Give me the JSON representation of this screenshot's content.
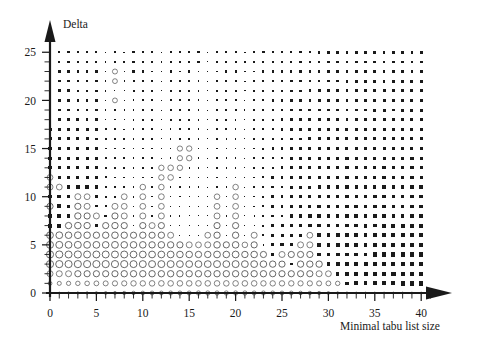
{
  "chart_data": {
    "type": "scatter",
    "title": "",
    "subtitle": "",
    "xlabel": "Minimal tabu list size",
    "ylabel": "Delta",
    "xlim": [
      -0.6,
      40.9
    ],
    "ylim": [
      -0.6,
      25.9
    ],
    "xticks": [
      0,
      5,
      10,
      15,
      20,
      25,
      30,
      35,
      40
    ],
    "yticks": [
      0,
      5,
      10,
      15,
      20,
      25
    ],
    "xtick_labels": [
      "0",
      "5",
      "10",
      "15",
      "20",
      "25",
      "30",
      "35",
      "40"
    ],
    "ytick_labels": [
      "0",
      "5",
      "10",
      "15",
      "20",
      "25"
    ],
    "x_minor_tick_step": 1,
    "y_minor_tick_step": 1,
    "grid": false,
    "legend": null,
    "marker_encoding": {
      "filled_square": "negative value; area proportional to magnitude",
      "open_circle": "positive value; area proportional to magnitude"
    },
    "colors": {
      "filled": "#1a1a1a",
      "open_stroke": "#4d4d4d",
      "axis": "#1a1a1a",
      "background": "#ffffff"
    },
    "x_values": [
      0,
      1,
      2,
      3,
      4,
      5,
      6,
      7,
      8,
      9,
      10,
      11,
      12,
      13,
      14,
      15,
      16,
      17,
      18,
      19,
      20,
      21,
      22,
      23,
      24,
      25,
      26,
      27,
      28,
      29,
      30,
      31,
      32,
      33,
      34,
      35,
      36,
      37,
      38,
      39,
      40
    ],
    "y_values": [
      0,
      1,
      2,
      3,
      4,
      5,
      6,
      7,
      8,
      9,
      10,
      11,
      12,
      13,
      14,
      15,
      16,
      17,
      18,
      19,
      20,
      21,
      22,
      23,
      24,
      25
    ],
    "matrix_note": "rows listed from Delta=25 (top) down to Delta=0 (bottom); each row lists 41 values for Minimal tabu list size 0..40. Negative = filled square, positive = open circle, magnitude = marker radius weight 0..1.",
    "matrix": [
      [
        -0.42,
        -0.4,
        -0.4,
        -0.4,
        -0.38,
        -0.38,
        -0.22,
        -0.4,
        -0.26,
        -0.38,
        -0.38,
        -0.38,
        -0.22,
        -0.38,
        -0.38,
        -0.38,
        -0.38,
        -0.22,
        -0.38,
        -0.38,
        -0.38,
        -0.26,
        -0.38,
        -0.38,
        -0.38,
        -0.38,
        -0.4,
        -0.38,
        -0.42,
        -0.44,
        -0.44,
        -0.44,
        -0.44,
        -0.46,
        -0.44,
        -0.46,
        -0.46,
        -0.44,
        -0.48,
        -0.46,
        -0.48
      ],
      [
        -0.44,
        -0.42,
        -0.42,
        -0.42,
        -0.4,
        -0.38,
        -0.26,
        -0.42,
        -0.26,
        -0.38,
        -0.36,
        -0.36,
        -0.22,
        -0.38,
        -0.36,
        -0.38,
        -0.36,
        -0.2,
        -0.36,
        -0.36,
        -0.38,
        -0.24,
        -0.36,
        -0.36,
        -0.4,
        -0.4,
        -0.42,
        -0.4,
        -0.44,
        -0.46,
        -0.44,
        -0.46,
        -0.46,
        -0.46,
        -0.46,
        -0.48,
        -0.46,
        -0.46,
        -0.48,
        -0.48,
        -0.48
      ],
      [
        -0.44,
        -0.44,
        -0.42,
        -0.42,
        -0.42,
        -0.4,
        -0.26,
        0.52,
        -0.24,
        -0.36,
        -0.36,
        -0.34,
        -0.22,
        -0.36,
        -0.34,
        -0.36,
        -0.34,
        -0.2,
        -0.34,
        -0.36,
        -0.36,
        -0.24,
        -0.34,
        -0.36,
        -0.4,
        -0.4,
        -0.42,
        -0.42,
        -0.44,
        -0.46,
        -0.46,
        -0.46,
        -0.46,
        -0.46,
        -0.48,
        -0.48,
        -0.48,
        -0.46,
        -0.5,
        -0.48,
        -0.48
      ],
      [
        -0.46,
        -0.44,
        -0.44,
        -0.44,
        -0.42,
        -0.4,
        -0.26,
        0.5,
        -0.24,
        -0.34,
        -0.34,
        -0.34,
        -0.2,
        -0.34,
        -0.34,
        -0.34,
        -0.34,
        -0.18,
        -0.34,
        -0.34,
        -0.34,
        -0.22,
        -0.34,
        -0.36,
        -0.4,
        -0.42,
        -0.44,
        -0.42,
        -0.46,
        -0.46,
        -0.46,
        -0.46,
        -0.48,
        -0.48,
        -0.48,
        -0.48,
        -0.48,
        -0.48,
        -0.5,
        -0.5,
        -0.5
      ],
      [
        -0.46,
        -0.46,
        -0.46,
        -0.44,
        -0.44,
        -0.42,
        -0.28,
        -0.16,
        -0.24,
        -0.34,
        -0.34,
        -0.32,
        -0.2,
        -0.32,
        -0.32,
        -0.32,
        -0.32,
        -0.18,
        -0.32,
        -0.32,
        -0.34,
        -0.22,
        -0.32,
        -0.36,
        -0.4,
        -0.42,
        -0.44,
        -0.44,
        -0.46,
        -0.48,
        -0.46,
        -0.48,
        -0.48,
        -0.48,
        -0.48,
        -0.5,
        -0.5,
        -0.48,
        -0.5,
        -0.5,
        -0.5
      ],
      [
        -0.48,
        -0.46,
        -0.46,
        -0.46,
        -0.44,
        -0.42,
        -0.26,
        0.5,
        -0.24,
        -0.32,
        -0.32,
        -0.32,
        -0.2,
        -0.32,
        -0.32,
        -0.32,
        -0.32,
        -0.18,
        -0.32,
        -0.32,
        -0.32,
        -0.2,
        -0.32,
        -0.34,
        -0.4,
        -0.42,
        -0.44,
        -0.44,
        -0.46,
        -0.48,
        -0.48,
        -0.48,
        -0.48,
        -0.5,
        -0.5,
        -0.5,
        -0.5,
        -0.5,
        -0.52,
        -0.52,
        -0.5
      ],
      [
        -0.48,
        -0.48,
        -0.48,
        -0.46,
        -0.46,
        -0.44,
        -0.28,
        -0.26,
        -0.24,
        -0.32,
        -0.3,
        -0.3,
        -0.18,
        -0.3,
        -0.3,
        -0.3,
        -0.3,
        -0.16,
        -0.3,
        -0.3,
        -0.32,
        -0.2,
        -0.3,
        -0.34,
        -0.4,
        -0.42,
        -0.44,
        -0.44,
        -0.48,
        -0.48,
        -0.48,
        -0.5,
        -0.5,
        -0.5,
        -0.5,
        -0.52,
        -0.52,
        -0.5,
        -0.52,
        -0.52,
        -0.52
      ],
      [
        -0.5,
        -0.48,
        -0.48,
        -0.48,
        -0.46,
        -0.44,
        -0.28,
        -0.26,
        -0.24,
        -0.3,
        -0.3,
        -0.3,
        -0.18,
        -0.3,
        -0.3,
        -0.3,
        -0.3,
        -0.16,
        -0.3,
        -0.3,
        -0.3,
        -0.2,
        -0.3,
        -0.34,
        -0.4,
        -0.42,
        -0.44,
        -0.46,
        -0.48,
        -0.5,
        -0.48,
        -0.5,
        -0.5,
        -0.52,
        -0.52,
        -0.52,
        -0.52,
        -0.52,
        -0.54,
        -0.52,
        -0.52
      ],
      [
        -0.52,
        -0.5,
        -0.5,
        -0.48,
        -0.48,
        -0.46,
        -0.3,
        -0.28,
        -0.26,
        -0.3,
        -0.3,
        -0.28,
        -0.18,
        -0.28,
        -0.28,
        -0.28,
        -0.28,
        -0.16,
        -0.28,
        -0.3,
        -0.3,
        -0.18,
        -0.3,
        -0.34,
        -0.4,
        -0.44,
        -0.44,
        -0.46,
        -0.48,
        -0.5,
        -0.5,
        -0.5,
        -0.52,
        -0.52,
        -0.52,
        -0.54,
        -0.52,
        -0.52,
        -0.54,
        -0.54,
        -0.52
      ],
      [
        -0.52,
        -0.52,
        -0.5,
        -0.5,
        -0.5,
        -0.46,
        -0.3,
        -0.28,
        -0.26,
        -0.3,
        -0.28,
        -0.28,
        -0.16,
        -0.28,
        -0.28,
        -0.28,
        -0.28,
        -0.16,
        -0.28,
        -0.28,
        -0.3,
        -0.18,
        -0.3,
        -0.34,
        -0.42,
        -0.44,
        -0.46,
        -0.46,
        -0.5,
        -0.5,
        -0.5,
        -0.52,
        -0.52,
        -0.52,
        -0.54,
        -0.54,
        -0.54,
        -0.54,
        -0.54,
        -0.54,
        -0.54
      ],
      [
        -0.54,
        -0.52,
        -0.52,
        -0.52,
        -0.5,
        -0.48,
        -0.32,
        -0.3,
        -0.26,
        -0.28,
        -0.28,
        -0.28,
        -0.16,
        -0.28,
        0.54,
        0.56,
        -0.26,
        -0.16,
        -0.28,
        -0.28,
        -0.28,
        -0.18,
        -0.28,
        -0.34,
        -0.42,
        -0.44,
        -0.46,
        -0.48,
        -0.5,
        -0.52,
        -0.5,
        -0.52,
        -0.52,
        -0.54,
        -0.54,
        -0.54,
        -0.54,
        -0.54,
        -0.56,
        -0.54,
        -0.54
      ],
      [
        -0.56,
        -0.54,
        -0.54,
        -0.52,
        -0.52,
        -0.5,
        -0.32,
        -0.3,
        -0.28,
        -0.28,
        -0.28,
        -0.26,
        -0.16,
        -0.26,
        0.54,
        0.56,
        -0.26,
        -0.16,
        -0.26,
        -0.28,
        -0.28,
        -0.16,
        -0.28,
        -0.34,
        -0.42,
        -0.44,
        -0.48,
        -0.48,
        -0.52,
        -0.52,
        -0.52,
        -0.54,
        -0.54,
        -0.54,
        -0.56,
        -0.56,
        -0.54,
        -0.56,
        -0.56,
        -0.56,
        -0.56
      ],
      [
        -0.58,
        -0.56,
        -0.56,
        -0.54,
        -0.54,
        -0.52,
        -0.34,
        -0.32,
        -0.28,
        -0.28,
        -0.26,
        -0.26,
        0.56,
        0.58,
        0.56,
        -0.24,
        -0.26,
        -0.14,
        -0.26,
        -0.26,
        -0.28,
        -0.16,
        -0.28,
        -0.34,
        -0.42,
        -0.46,
        -0.48,
        -0.5,
        -0.52,
        -0.54,
        -0.54,
        -0.54,
        -0.56,
        -0.56,
        -0.56,
        -0.56,
        -0.56,
        -0.56,
        -0.58,
        -0.56,
        -0.56
      ],
      [
        0.6,
        -0.58,
        -0.58,
        -0.56,
        -0.56,
        -0.54,
        -0.36,
        -0.32,
        -0.3,
        -0.28,
        -0.26,
        -0.26,
        0.56,
        0.58,
        -0.24,
        -0.24,
        -0.24,
        -0.14,
        -0.26,
        -0.26,
        -0.26,
        -0.16,
        -0.26,
        -0.34,
        -0.44,
        -0.46,
        -0.5,
        -0.5,
        -0.54,
        -0.54,
        -0.54,
        -0.56,
        -0.56,
        -0.58,
        -0.58,
        -0.58,
        -0.58,
        -0.58,
        -0.58,
        -0.58,
        -0.58
      ],
      [
        0.62,
        0.6,
        -0.6,
        -0.58,
        -0.58,
        -0.56,
        -0.38,
        -0.34,
        -0.3,
        -0.28,
        0.58,
        -0.24,
        0.58,
        -0.22,
        -0.22,
        -0.22,
        -0.22,
        -0.14,
        -0.24,
        -0.24,
        0.58,
        -0.14,
        -0.26,
        -0.34,
        -0.44,
        -0.48,
        -0.5,
        -0.52,
        -0.54,
        -0.56,
        -0.56,
        -0.58,
        -0.58,
        -0.58,
        -0.6,
        -0.58,
        -0.6,
        -0.58,
        -0.6,
        -0.6,
        -0.6
      ],
      [
        -0.62,
        -0.62,
        -0.62,
        0.62,
        0.6,
        -0.56,
        -0.4,
        -0.34,
        0.6,
        -0.28,
        0.6,
        -0.24,
        0.6,
        -0.22,
        -0.22,
        -0.22,
        -0.2,
        -0.12,
        0.58,
        -0.24,
        0.58,
        -0.14,
        -0.24,
        -0.34,
        -0.44,
        -0.48,
        -0.52,
        -0.52,
        -0.56,
        -0.56,
        -0.58,
        -0.58,
        -0.6,
        -0.6,
        -0.6,
        -0.6,
        -0.6,
        -0.6,
        -0.62,
        -0.6,
        -0.6
      ],
      [
        0.64,
        -0.64,
        -0.62,
        0.64,
        0.62,
        -0.4,
        -0.4,
        0.62,
        0.6,
        -0.26,
        0.6,
        -0.22,
        0.6,
        -0.2,
        -0.2,
        -0.2,
        -0.2,
        -0.12,
        0.6,
        -0.22,
        0.6,
        -0.12,
        -0.24,
        -0.34,
        -0.46,
        -0.5,
        -0.52,
        -0.54,
        -0.56,
        -0.58,
        -0.58,
        -0.6,
        -0.6,
        -0.62,
        -0.62,
        -0.62,
        -0.62,
        -0.62,
        -0.62,
        -0.62,
        -0.62
      ],
      [
        -0.66,
        -0.66,
        -0.64,
        0.66,
        0.64,
        0.62,
        -0.42,
        0.64,
        0.62,
        -0.24,
        0.62,
        -0.22,
        0.62,
        -0.2,
        -0.2,
        -0.18,
        -0.18,
        -0.1,
        0.62,
        -0.2,
        0.62,
        -0.12,
        -0.22,
        -0.34,
        -0.46,
        -0.5,
        -0.54,
        -0.54,
        -0.58,
        -0.58,
        -0.6,
        -0.62,
        -0.62,
        -0.62,
        -0.64,
        -0.64,
        -0.64,
        -0.64,
        -0.64,
        -0.64,
        -0.64
      ],
      [
        -0.68,
        -0.68,
        0.66,
        0.68,
        0.66,
        -0.42,
        0.64,
        0.66,
        0.64,
        -0.24,
        0.64,
        0.62,
        0.64,
        -0.18,
        -0.18,
        -0.18,
        -0.16,
        -0.1,
        0.64,
        -0.2,
        0.64,
        -0.1,
        -0.22,
        -0.34,
        -0.48,
        -0.52,
        -0.54,
        -0.56,
        -0.58,
        -0.6,
        -0.62,
        -0.62,
        -0.64,
        -0.64,
        -0.66,
        -0.64,
        -0.66,
        -0.66,
        -0.66,
        -0.66,
        -0.66
      ],
      [
        0.7,
        0.7,
        0.68,
        0.7,
        0.68,
        0.66,
        0.66,
        0.68,
        0.66,
        0.64,
        0.66,
        0.64,
        0.66,
        0.62,
        -0.16,
        -0.16,
        -0.14,
        0.6,
        0.66,
        -0.18,
        0.66,
        -0.1,
        0.62,
        -0.34,
        -0.48,
        -0.52,
        -0.56,
        -0.56,
        0.6,
        -0.6,
        -0.62,
        -0.64,
        -0.64,
        -0.66,
        -0.66,
        -0.66,
        -0.68,
        -0.68,
        -0.68,
        -0.68,
        -0.68
      ],
      [
        0.72,
        0.72,
        0.7,
        0.72,
        0.7,
        0.7,
        0.68,
        0.7,
        0.68,
        0.68,
        0.68,
        0.66,
        0.68,
        0.66,
        0.64,
        0.62,
        0.6,
        0.62,
        0.68,
        0.64,
        0.68,
        0.58,
        0.64,
        -0.32,
        -0.5,
        -0.54,
        -0.56,
        0.62,
        0.62,
        -0.6,
        -0.64,
        -0.64,
        -0.66,
        -0.66,
        -0.68,
        -0.68,
        -0.68,
        -0.7,
        -0.7,
        -0.7,
        -0.7
      ],
      [
        0.74,
        0.74,
        0.72,
        0.74,
        0.72,
        0.72,
        0.72,
        0.72,
        0.72,
        0.7,
        0.7,
        0.7,
        0.7,
        0.7,
        0.68,
        0.68,
        0.66,
        0.66,
        0.7,
        0.68,
        0.7,
        0.66,
        0.68,
        0.64,
        -0.5,
        0.62,
        0.64,
        0.64,
        0.64,
        -0.58,
        -0.64,
        -0.66,
        -0.66,
        -0.68,
        -0.68,
        -0.7,
        -0.7,
        -0.7,
        -0.72,
        -0.72,
        -0.72
      ],
      [
        0.74,
        0.74,
        0.74,
        0.74,
        0.74,
        0.74,
        0.74,
        0.74,
        0.74,
        0.72,
        0.72,
        0.72,
        0.72,
        0.72,
        0.7,
        0.7,
        0.7,
        0.7,
        0.72,
        0.7,
        0.72,
        0.7,
        0.7,
        0.68,
        0.66,
        0.64,
        -0.44,
        0.66,
        0.66,
        0.66,
        -0.62,
        -0.66,
        -0.68,
        -0.7,
        -0.7,
        -0.72,
        -0.72,
        -0.72,
        -0.74,
        -0.74,
        -0.74
      ],
      [
        0.62,
        0.62,
        0.62,
        0.64,
        0.64,
        0.64,
        0.64,
        0.64,
        0.66,
        0.66,
        0.66,
        0.66,
        0.66,
        0.66,
        0.66,
        0.66,
        0.66,
        0.66,
        0.66,
        0.66,
        0.66,
        0.66,
        0.66,
        0.66,
        0.64,
        0.64,
        0.64,
        0.64,
        0.64,
        0.62,
        0.6,
        -0.62,
        -0.66,
        -0.68,
        -0.7,
        -0.72,
        -0.72,
        -0.74,
        -0.74,
        -0.74,
        -0.74
      ],
      [
        0.4,
        0.42,
        0.44,
        0.46,
        0.48,
        0.5,
        0.52,
        0.54,
        0.54,
        0.56,
        0.56,
        0.58,
        0.58,
        0.58,
        0.58,
        0.58,
        0.58,
        0.58,
        0.58,
        0.58,
        0.58,
        0.58,
        0.58,
        0.56,
        0.56,
        0.56,
        0.56,
        0.54,
        0.54,
        0.52,
        0.5,
        0.46,
        -0.6,
        -0.66,
        -0.68,
        -0.7,
        -0.72,
        -0.72,
        -0.74,
        -0.74,
        -0.74
      ],
      [
        0.14,
        0.18,
        0.22,
        0.24,
        0.26,
        0.28,
        0.3,
        0.32,
        0.34,
        0.36,
        0.38,
        0.4,
        0.4,
        0.42,
        0.42,
        0.42,
        0.44,
        0.44,
        0.44,
        0.44,
        0.44,
        0.44,
        0.42,
        0.42,
        0.42,
        0.4,
        0.4,
        0.38,
        0.36,
        0.34,
        0.3,
        0.26,
        0.22,
        0.18,
        0.14,
        0.12,
        0.1,
        0.1,
        0.1,
        0.1,
        0.1
      ]
    ]
  },
  "axes": {
    "x_title": "Minimal tabu list size",
    "y_title": "Delta"
  }
}
